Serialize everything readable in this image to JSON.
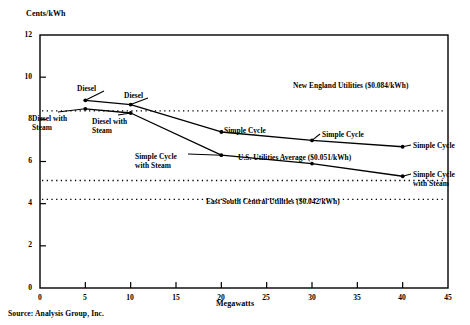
{
  "figure": {
    "source_note": "Source: Analysis Group, Inc."
  },
  "chart_data": {
    "type": "line",
    "title": "",
    "xlabel": "Megawatts",
    "ylabel": "Cents/kWh",
    "xlim": [
      0,
      45
    ],
    "ylim": [
      0,
      12
    ],
    "grid": false,
    "legend": "none (inline point labels)",
    "xticks": [
      0,
      5,
      10,
      15,
      20,
      25,
      30,
      35,
      40,
      45
    ],
    "xtick_labels": [
      "0",
      "5",
      "10",
      "15",
      "20",
      "25",
      "30",
      "35",
      "40",
      "45"
    ],
    "yticks": [
      0,
      2,
      4,
      6,
      8,
      10,
      12
    ],
    "ytick_labels": [
      "0",
      "2",
      "4",
      "6",
      "8",
      "10",
      "12"
    ],
    "x": [
      5,
      10,
      20,
      30,
      40
    ],
    "series": [
      {
        "name": "Diesel / Simple Cycle",
        "values": [
          8.9,
          8.7,
          7.4,
          7.0,
          6.7
        ],
        "marker": "dot"
      },
      {
        "name": "Diesel with Steam / Simple Cycle with Steam",
        "values": [
          8.5,
          8.3,
          6.3,
          5.9,
          5.3
        ],
        "marker": "dot"
      }
    ],
    "reference_lines": [
      {
        "label": "New England Utilities ($0.084/kWh)",
        "value": 8.4,
        "style": "dotted"
      },
      {
        "label": "U.S. Utilities Average ($0.051/kWh)",
        "value": 5.1,
        "style": "dotted"
      },
      {
        "label": "East South Central Utilities ($0.042/kWh)",
        "value": 4.2,
        "style": "dotted"
      }
    ],
    "point_annotations": [
      {
        "text": "Diesel",
        "at_x": 5,
        "at_y": 8.9
      },
      {
        "text": "Diesel with Steam",
        "at_x": 5,
        "at_y": 8.5
      },
      {
        "text": "Diesel",
        "at_x": 10,
        "at_y": 8.7
      },
      {
        "text": "Diesel with Steam",
        "at_x": 10,
        "at_y": 8.3
      },
      {
        "text": "Simple Cycle",
        "at_x": 20,
        "at_y": 7.4
      },
      {
        "text": "Simple Cycle with Steam",
        "at_x": 20,
        "at_y": 6.3
      },
      {
        "text": "Simple Cycle",
        "at_x": 30,
        "at_y": 7.0
      },
      {
        "text": "Simple Cycle",
        "at_x": 40,
        "at_y": 6.7
      },
      {
        "text": "Simple Cycle with Steam",
        "at_x": 40,
        "at_y": 5.3
      }
    ]
  },
  "labels": {
    "y_axis_title": "Cents/kWh",
    "x_axis_title": "Megawatts",
    "ytick_12": "12",
    "ytick_10": "10",
    "ytick_8": "8",
    "ytick_6": "6",
    "ytick_4": "4",
    "ytick_2": "2",
    "ytick_0": "0",
    "xtick_0": "0",
    "xtick_5": "5",
    "xtick_10": "10",
    "xtick_15": "15",
    "xtick_20": "20",
    "xtick_25": "25",
    "xtick_30": "30",
    "xtick_35": "35",
    "xtick_40": "40",
    "xtick_45": "45",
    "new_england": "New England Utilities ($0.084/kWh)",
    "us_average": "U.S. Utilities Average ($0.051/kWh)",
    "east_south_central": "East South Central Utilities ($0.042/kWh)",
    "diesel_1": "Diesel",
    "diesel_steam_1_line1": "Diesel with",
    "diesel_steam_1_line2": "Steam",
    "diesel_2": "Diesel",
    "diesel_steam_2_line1": "Diesel with",
    "diesel_steam_2_line2": "Steam",
    "simple_cycle_20": "Simple Cycle",
    "simple_cycle_steam_20_line1": "Simple Cycle",
    "simple_cycle_steam_20_line2": "with Steam",
    "simple_cycle_30": "Simple Cycle",
    "simple_cycle_40": "Simple Cycle",
    "simple_cycle_steam_40_line1": "Simple Cycle",
    "simple_cycle_steam_40_line2": "with Steam"
  }
}
